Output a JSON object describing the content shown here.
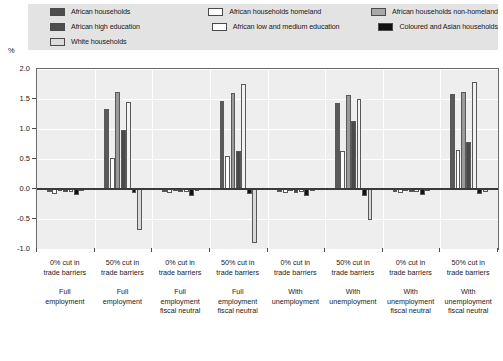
{
  "axis": {
    "y_unit_label": "%",
    "y_ticks": [
      "2.0",
      "1.5",
      "1.0",
      "0.5",
      "0.0",
      "-0.5",
      "-1.0"
    ]
  },
  "legend": {
    "items": [
      {
        "label": "African households",
        "swatch": "sw-dark",
        "key": "african_households"
      },
      {
        "label": "African households homeland",
        "swatch": "sw-white",
        "key": "african_households_homeland"
      },
      {
        "label": "African households non-homeland",
        "swatch": "sw-mid",
        "key": "african_households_non_homeland"
      },
      {
        "label": "African high education",
        "swatch": "sw-dark",
        "key": "african_high_education"
      },
      {
        "label": "African low and medium education",
        "swatch": "sw-white",
        "key": "african_low_and_medium_education"
      },
      {
        "label": "Coloured and Asian households",
        "swatch": "sw-black",
        "key": "coloured_and_asian_households"
      },
      {
        "label": "White households",
        "swatch": "sw-stipple",
        "key": "white_households"
      }
    ]
  },
  "chart_data": {
    "type": "bar",
    "title": "",
    "xlabel": "",
    "ylabel": "%",
    "ylim": [
      -1.0,
      2.0
    ],
    "ytick_step": 0.5,
    "grid": true,
    "legend_position": "top",
    "categories": [
      {
        "line1": "0% cut in",
        "line2": "trade barriers",
        "line3": "Full",
        "line4": "employment",
        "line5": ""
      },
      {
        "line1": "50% cut in",
        "line2": "trade barriers",
        "line3": "Full",
        "line4": "employment",
        "line5": ""
      },
      {
        "line1": "0% cut in",
        "line2": "trade barriers",
        "line3": "Full",
        "line4": "employment",
        "line5": "fiscal neutral"
      },
      {
        "line1": "50% cut in",
        "line2": "trade barriers",
        "line3": "Full",
        "line4": "employment",
        "line5": "fiscal neutral"
      },
      {
        "line1": "0% cut in",
        "line2": "trade barriers",
        "line3": "With",
        "line4": "unemployment",
        "line5": ""
      },
      {
        "line1": "50% cut in",
        "line2": "trade barriers",
        "line3": "With",
        "line4": "unemployment",
        "line5": ""
      },
      {
        "line1": "0% cut in",
        "line2": "trade barriers",
        "line3": "With",
        "line4": "unemployment",
        "line5": "fiscal neutral"
      },
      {
        "line1": "50% cut in",
        "line2": "trade barriers",
        "line3": "With",
        "line4": "unemployment",
        "line5": "fiscal neutral"
      }
    ],
    "series": [
      {
        "name": "African households",
        "cls": "f-afh",
        "values": [
          -0.05,
          1.33,
          -0.05,
          1.47,
          -0.05,
          1.43,
          -0.05,
          1.58
        ]
      },
      {
        "name": "African households homeland",
        "cls": "f-afhh",
        "values": [
          -0.08,
          0.52,
          -0.06,
          0.55,
          -0.07,
          0.63,
          -0.06,
          0.65
        ]
      },
      {
        "name": "African households non-homeland",
        "cls": "f-afhnh",
        "values": [
          -0.04,
          1.62,
          -0.04,
          1.6,
          -0.04,
          1.57,
          -0.04,
          1.62
        ]
      },
      {
        "name": "African high education",
        "cls": "f-afhe",
        "values": [
          -0.05,
          0.99,
          -0.05,
          0.63,
          -0.06,
          1.14,
          -0.05,
          0.78
        ]
      },
      {
        "name": "African low and medium education",
        "cls": "f-aflme",
        "values": [
          -0.05,
          1.45,
          -0.05,
          1.75,
          -0.05,
          1.5,
          -0.05,
          1.78
        ]
      },
      {
        "name": "Coloured and Asian households",
        "cls": "f-coas",
        "values": [
          -0.1,
          -0.07,
          -0.11,
          -0.09,
          -0.11,
          -0.12,
          -0.1,
          -0.08
        ]
      },
      {
        "name": "White households",
        "cls": "f-white",
        "values": [
          -0.02,
          -0.68,
          -0.02,
          -0.9,
          -0.02,
          -0.52,
          -0.02,
          -0.05
        ]
      }
    ]
  }
}
